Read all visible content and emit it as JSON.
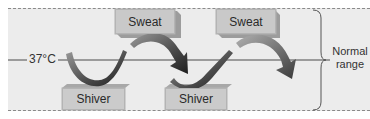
{
  "diagram": {
    "setpoint_label": "37°C",
    "range_label_line1": "Normal",
    "range_label_line2": "range",
    "blocks": {
      "sweat_1": "Sweat",
      "sweat_2": "Sweat",
      "shiver_1": "Shiver",
      "shiver_2": "Shiver"
    },
    "colors": {
      "background": "#ececec",
      "block_face": "#c9c9c9",
      "arrow_dark": "#2a2a2a",
      "arrow_mid": "#7a7a7a",
      "dash": "#8a8a8a"
    }
  }
}
